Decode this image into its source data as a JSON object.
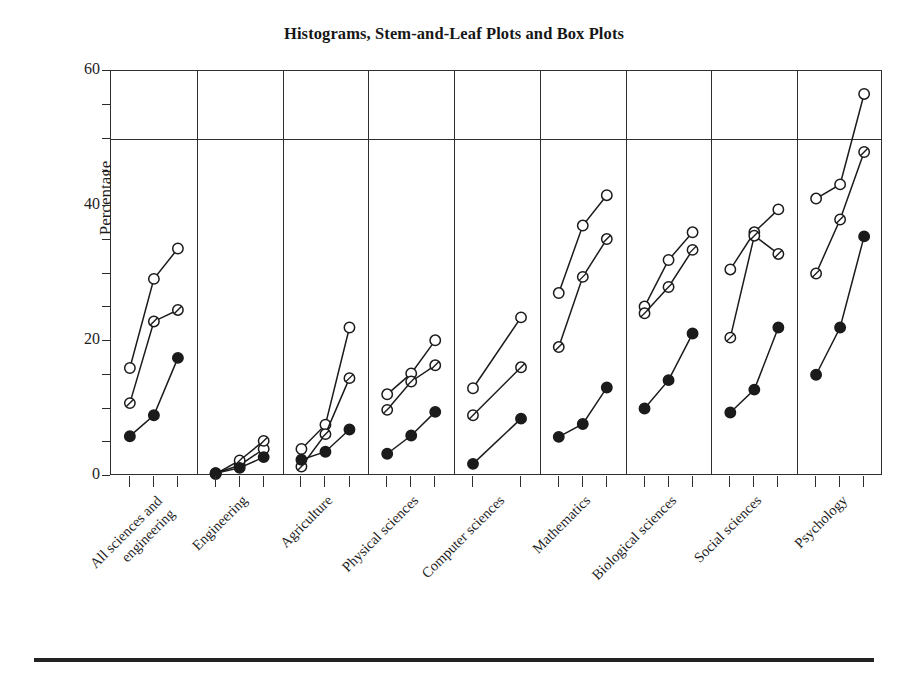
{
  "chart": {
    "title": "Histograms, Stem-and-Leaf Plots and Box Plots",
    "ylabel": "Percentage",
    "ytick_labels": [
      "0",
      "20",
      "40",
      "60"
    ]
  },
  "chart_data": {
    "type": "line",
    "title": "Histograms, Stem-and-Leaf Plots and Box Plots",
    "xlabel": "",
    "ylabel": "Percentage",
    "ylim": [
      0,
      60
    ],
    "yticks": [
      0,
      20,
      40,
      60
    ],
    "grid": false,
    "legend": "none",
    "reference_line": 50,
    "panel_layout": "one panel per category, shared y-axis",
    "categories": [
      "All sciences and engineering",
      "Engineering",
      "Agriculture",
      "Physical sciences",
      "Computer sciences",
      "Mathematics",
      "Biological sciences",
      "Social sciences",
      "Psychology"
    ],
    "series": [
      {
        "name": "open-circle",
        "marker": "open circle",
        "panels": [
          [
            16.0,
            29.2,
            33.7
          ],
          [
            0.4,
            1.6,
            4.0
          ],
          [
            4.0,
            7.6,
            22.0
          ],
          [
            12.1,
            15.2,
            20.1
          ],
          [
            13.0,
            23.5
          ],
          [
            27.1,
            37.1,
            41.6
          ],
          [
            25.1,
            32.0,
            36.1
          ],
          [
            30.6,
            36.1,
            39.5
          ],
          [
            41.1,
            43.2,
            56.6
          ]
        ]
      },
      {
        "name": "half-filled-circle",
        "marker": "half filled circle",
        "panels": [
          [
            10.8,
            22.9,
            24.6
          ],
          [
            0.3,
            2.3,
            5.2
          ],
          [
            1.4,
            6.2,
            14.5
          ],
          [
            9.8,
            14.0,
            16.4
          ],
          [
            9.0,
            16.1
          ],
          [
            19.1,
            29.5,
            35.1
          ],
          [
            24.1,
            28.0,
            33.5
          ],
          [
            20.5,
            35.6,
            32.9
          ],
          [
            30.0,
            38.0,
            48.0
          ]
        ]
      },
      {
        "name": "filled-circle",
        "marker": "filled circle",
        "panels": [
          [
            5.9,
            9.0,
            17.5
          ],
          [
            0.4,
            1.2,
            2.8
          ],
          [
            2.4,
            3.6,
            6.9
          ],
          [
            3.3,
            6.0,
            9.5
          ],
          [
            1.8,
            8.5
          ],
          [
            5.8,
            7.7,
            13.1
          ],
          [
            10.0,
            14.2,
            21.1
          ],
          [
            9.4,
            12.8,
            22.0
          ],
          [
            15.0,
            22.0,
            35.5
          ]
        ]
      }
    ]
  }
}
